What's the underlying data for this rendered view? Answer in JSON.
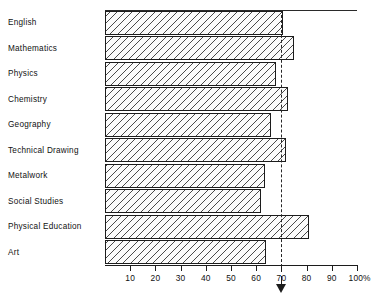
{
  "chart_data": {
    "type": "bar",
    "orientation": "horizontal",
    "title": "",
    "xlabel": "",
    "ylabel": "",
    "xlim": [
      0,
      100
    ],
    "grid": false,
    "legend": null,
    "unit_suffix": "%",
    "categories": [
      "English",
      "Mathematics",
      "Physics",
      "Chemistry",
      "Geography",
      "Technical Drawing",
      "Metalwork",
      "Social Studies",
      "Physical Education",
      "Art"
    ],
    "values": [
      70.5,
      75,
      68,
      72.5,
      66,
      72,
      63.5,
      62,
      81,
      64
    ],
    "tick_values": [
      10,
      20,
      30,
      40,
      50,
      60,
      70,
      80,
      90,
      100
    ],
    "tick_labels": [
      "10",
      "20",
      "30",
      "40",
      "50",
      "60",
      "70",
      "80",
      "90",
      "100%"
    ],
    "reference_line": {
      "value": 70,
      "style": "dashed",
      "marker": "down-arrow"
    }
  },
  "colors": {
    "ink": "#1c1c1c",
    "bar_fill": "#fbfbfb",
    "hatch": "#4a4a4a",
    "background": "#ffffff"
  }
}
